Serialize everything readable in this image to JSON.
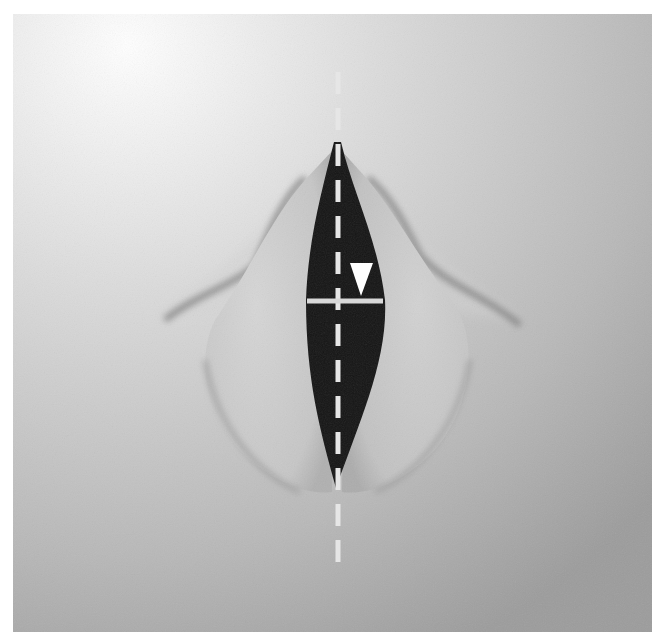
{
  "figure": {
    "width": 663,
    "height": 642,
    "frame": {
      "x": 13,
      "y": 14,
      "width": 639,
      "height": 618
    },
    "colors": {
      "page_background": "#ffffff",
      "tissue_light": "#e4e4e4",
      "tissue_mid": "#c4c4c4",
      "tissue_dark": "#9a9a9a",
      "fold_shadow": "#6f6f6f",
      "glottal_gap": "#141414",
      "annotation": "#e6e6e6",
      "marker": "#ffffff"
    }
  },
  "annotations": {
    "midline": {
      "type": "dashed-vertical-line",
      "x": 338,
      "y_start": 72,
      "y_end": 562,
      "dash_length": 22,
      "gap_length": 14,
      "stroke_width": 5
    },
    "width_line": {
      "type": "horizontal-line",
      "y": 301,
      "x_start": 307,
      "x_end": 383,
      "stroke_width": 5
    },
    "marker": {
      "type": "down-pointing-triangle",
      "points": [
        [
          350,
          263
        ],
        [
          373,
          263
        ],
        [
          361,
          296
        ]
      ]
    }
  },
  "glottis": {
    "apex": [
      337,
      142
    ],
    "widest_y": 300,
    "left_x_at_widest": 306,
    "right_x_at_widest": 384,
    "bottom": [
      331,
      488
    ]
  }
}
